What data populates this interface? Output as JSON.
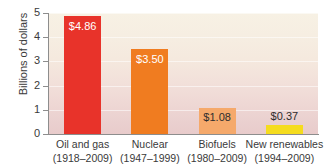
{
  "chart_data": {
    "type": "bar",
    "title": "",
    "xlabel": "",
    "ylabel": "Billions of dollars",
    "ylim": [
      0,
      5
    ],
    "yticks": [
      "0",
      "1",
      "2",
      "3",
      "4",
      "5"
    ],
    "grid": true,
    "legend": "none",
    "categories": [
      "Oil and gas",
      "Nuclear",
      "Biofuels",
      "New renewables"
    ],
    "category_years": [
      "(1918–2009)",
      "(1947–1999)",
      "(1980–2009)",
      "(1994–2009)"
    ],
    "values": [
      4.86,
      3.5,
      1.08,
      0.37
    ],
    "value_labels": [
      "$4.86",
      "$3.50",
      "$1.08",
      "$0.37"
    ],
    "bar_colors": [
      "#e8332a",
      "#f07c20",
      "#f5a96b",
      "#f5dc1e"
    ],
    "label_placement": [
      "inside",
      "inside",
      "inside-dark",
      "above"
    ]
  },
  "axes": {
    "y_title": "Billions of dollars"
  },
  "colors": {
    "axis": "#8d8d8d",
    "text": "#3a3a3a",
    "plot_background_top": "#f7f1e4",
    "plot_background_bottom": "#e8cbcb"
  }
}
